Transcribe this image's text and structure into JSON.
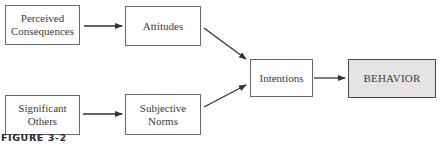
{
  "diagram": {
    "nodes": {
      "perceived_consequences": "Perceived\nConsequences",
      "attitudes": "Attitudes",
      "significant_others": "Significant\nOthers",
      "subjective_norms": "Subjective\nNorms",
      "intentions": "Intentions",
      "behavior": "BEHAVIOR"
    },
    "edges": [
      {
        "from": "perceived_consequences",
        "to": "attitudes"
      },
      {
        "from": "significant_others",
        "to": "subjective_norms"
      },
      {
        "from": "attitudes",
        "to": "intentions"
      },
      {
        "from": "subjective_norms",
        "to": "intentions"
      },
      {
        "from": "intentions",
        "to": "behavior"
      }
    ],
    "colors": {
      "border": "#6a6a6a",
      "arrow": "#333333",
      "behavior_fill": "#e4e4e4"
    }
  },
  "caption": "FIGURE 3-2"
}
